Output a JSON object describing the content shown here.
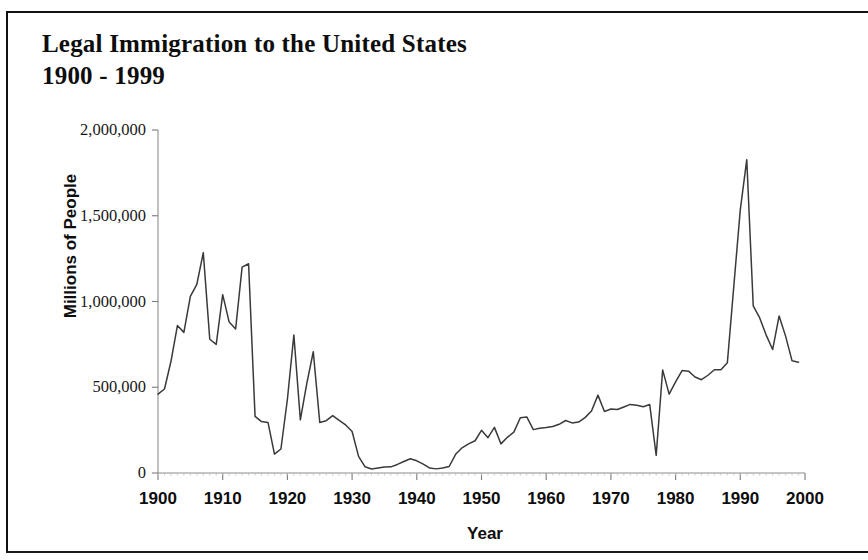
{
  "figure": {
    "title_line1": "Legal Immigration to the United States",
    "title_line2": "1900 - 1999",
    "frame_color": "#111111",
    "line_color": "#3a3a3a",
    "background": "#ffffff"
  },
  "chart_data": {
    "type": "line",
    "title": "Legal Immigration to the United States 1900 - 1999",
    "xlabel": "Year",
    "ylabel": "Millions of People",
    "xlim": [
      1900,
      2000
    ],
    "ylim": [
      0,
      2000000
    ],
    "grid": false,
    "legend": null,
    "xticks": [
      1900,
      1910,
      1920,
      1930,
      1940,
      1950,
      1960,
      1970,
      1980,
      1990,
      2000
    ],
    "xtick_labels": [
      "1900",
      "1910",
      "1920",
      "1930",
      "1940",
      "1950",
      "1960",
      "1970",
      "1980",
      "1990",
      "2000"
    ],
    "yticks": [
      0,
      500000,
      1000000,
      1500000,
      2000000
    ],
    "ytick_labels": [
      "0",
      "500,000",
      "1,000,000",
      "1,500,000",
      "2,000,000"
    ],
    "series": [
      {
        "name": "Legal immigrants admitted",
        "x": [
          1900,
          1901,
          1902,
          1903,
          1904,
          1905,
          1906,
          1907,
          1908,
          1909,
          1910,
          1911,
          1912,
          1913,
          1914,
          1915,
          1916,
          1917,
          1918,
          1919,
          1920,
          1921,
          1922,
          1923,
          1924,
          1925,
          1926,
          1927,
          1928,
          1929,
          1930,
          1931,
          1932,
          1933,
          1934,
          1935,
          1936,
          1937,
          1938,
          1939,
          1940,
          1941,
          1942,
          1943,
          1944,
          1945,
          1946,
          1947,
          1948,
          1949,
          1950,
          1951,
          1952,
          1953,
          1954,
          1955,
          1956,
          1957,
          1958,
          1959,
          1960,
          1961,
          1962,
          1963,
          1964,
          1965,
          1966,
          1967,
          1968,
          1969,
          1970,
          1971,
          1972,
          1973,
          1974,
          1975,
          1976,
          1977,
          1978,
          1979,
          1980,
          1981,
          1982,
          1983,
          1984,
          1985,
          1986,
          1987,
          1988,
          1989,
          1990,
          1991,
          1992,
          1993,
          1994,
          1995,
          1996,
          1997,
          1998,
          1999
        ],
        "y": [
          460000,
          490000,
          650000,
          860000,
          820000,
          1030000,
          1100000,
          1285000,
          780000,
          750000,
          1040000,
          880000,
          840000,
          1200000,
          1220000,
          330000,
          300000,
          295000,
          110000,
          140000,
          430000,
          805000,
          310000,
          523000,
          707000,
          295000,
          305000,
          335000,
          307000,
          280000,
          242000,
          97000,
          36000,
          23000,
          29000,
          35000,
          36000,
          50000,
          67000,
          83000,
          71000,
          52000,
          29000,
          24000,
          29000,
          38000,
          109000,
          147000,
          170000,
          188000,
          249000,
          206000,
          266000,
          170000,
          208000,
          238000,
          322000,
          327000,
          253000,
          261000,
          265000,
          271000,
          284000,
          306000,
          292000,
          297000,
          323000,
          362000,
          454000,
          359000,
          373000,
          370000,
          385000,
          400000,
          395000,
          386000,
          399000,
          103000,
          601000,
          460000,
          531000,
          597000,
          594000,
          560000,
          544000,
          570000,
          602000,
          602000,
          643000,
          1091000,
          1536000,
          1827000,
          974000,
          904000,
          804000,
          720000,
          916000,
          798000,
          654000,
          646000
        ]
      }
    ]
  },
  "axes": {
    "ytick_labels": [
      "2,000,000",
      "1,500,000",
      "1,000,000",
      "500,000",
      "0"
    ],
    "xtick_labels": [
      "1900",
      "1910",
      "1920",
      "1930",
      "1940",
      "1950",
      "1960",
      "1970",
      "1980",
      "1990",
      "2000"
    ]
  }
}
